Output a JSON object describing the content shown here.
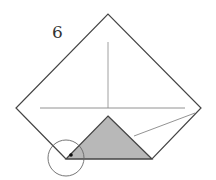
{
  "diagram": {
    "step_number": "6",
    "colors": {
      "outline": "#444444",
      "crease": "#777777",
      "shaded_flap": "#b8b8b8",
      "background": "#ffffff"
    },
    "shapes": {
      "square_outline": "108,14 201,108 152,159 66,159 16,108",
      "horizontal_crease": [
        40,
        108,
        185,
        108
      ],
      "vertical_crease": [
        108,
        42,
        108,
        108
      ],
      "diagonal_crease": [
        134,
        136,
        195,
        113
      ],
      "shaded_triangle": "108,116 152,159 66,159",
      "highlight_circle": [
        66,
        158,
        18
      ],
      "reference_dot": [
        71,
        155
      ]
    }
  }
}
